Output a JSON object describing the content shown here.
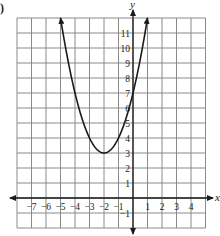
{
  "problem_marker": ")",
  "axes": {
    "x_name": "x",
    "y_name": "y"
  },
  "x_tick_labels": [
    "−7",
    "−6",
    "−5",
    "−4",
    "−3",
    "−2",
    "−1",
    "1",
    "2",
    "3",
    "4"
  ],
  "y_tick_labels": [
    "11",
    "10",
    "9",
    "8",
    "7",
    "6",
    "5",
    "4",
    "3",
    "2",
    "1",
    "−1"
  ],
  "colors": {
    "grid": "#8a8a8a",
    "ink": "#1a1a1a",
    "background": "#ffffff"
  },
  "chart_data": {
    "type": "line",
    "title": "",
    "xlabel": "x",
    "ylabel": "y",
    "xlim": [
      -8,
      5
    ],
    "ylim": [
      -2,
      12
    ],
    "grid": true,
    "series": [
      {
        "name": "parabola y = (x + 2)^2 + 3",
        "vertex": [
          -2,
          3
        ],
        "x": [
          -5,
          -4,
          -3,
          -2,
          -1,
          0,
          1
        ],
        "y": [
          12,
          7,
          4,
          3,
          4,
          7,
          12
        ]
      }
    ],
    "x_ticks": [
      -7,
      -6,
      -5,
      -4,
      -3,
      -2,
      -1,
      1,
      2,
      3,
      4
    ],
    "y_ticks": [
      -1,
      1,
      2,
      3,
      4,
      5,
      6,
      7,
      8,
      9,
      10,
      11
    ]
  }
}
